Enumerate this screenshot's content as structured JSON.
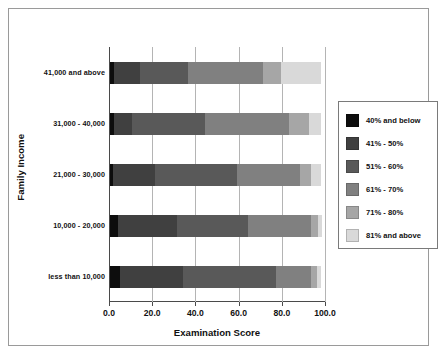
{
  "chart_data": {
    "type": "bar",
    "orientation": "horizontal",
    "stacked": true,
    "title": "",
    "xlabel": "Examination Score",
    "ylabel": "Family Income",
    "xlim": [
      0.0,
      100.0
    ],
    "xticks": [
      "0.0",
      "20.0",
      "40.0",
      "60.0",
      "80.0",
      "100.0"
    ],
    "xtick_values": [
      0,
      20,
      40,
      60,
      80,
      100
    ],
    "grid": true,
    "legend_position": "right",
    "categories": [
      "41,000 and above",
      "31,000 - 40,000",
      "21,000 - 30,000",
      "10,000 - 20,000",
      "less than 10,000"
    ],
    "series": [
      {
        "name": "40% and below",
        "color": "#0d0d0d",
        "values": [
          2.0,
          2.0,
          1.5,
          3.5,
          4.5
        ]
      },
      {
        "name": "41% - 50%",
        "color": "#404040",
        "values": [
          12.0,
          8.0,
          19.5,
          27.5,
          29.5
        ]
      },
      {
        "name": "51% - 60%",
        "color": "#595959",
        "values": [
          22.0,
          34.0,
          38.0,
          33.0,
          43.0
        ]
      },
      {
        "name": "61% - 70%",
        "color": "#808080",
        "values": [
          35.0,
          39.0,
          29.0,
          29.0,
          16.0
        ]
      },
      {
        "name": "71% - 80%",
        "color": "#a6a6a6",
        "values": [
          8.0,
          9.0,
          5.0,
          3.5,
          3.0
        ]
      },
      {
        "name": "81% and above",
        "color": "#d9d9d9",
        "values": [
          18.5,
          5.5,
          4.5,
          1.5,
          1.5
        ]
      }
    ]
  },
  "legend": {
    "items": [
      {
        "label": "40% and below",
        "color": "#0d0d0d"
      },
      {
        "label": "41% - 50%",
        "color": "#404040"
      },
      {
        "label": "51% - 60%",
        "color": "#595959"
      },
      {
        "label": "61% - 70%",
        "color": "#808080"
      },
      {
        "label": "71% - 80%",
        "color": "#a6a6a6"
      },
      {
        "label": "81% and above",
        "color": "#d9d9d9"
      }
    ]
  },
  "axes": {
    "x_title": "Examination Score",
    "y_title": "Family Income"
  }
}
